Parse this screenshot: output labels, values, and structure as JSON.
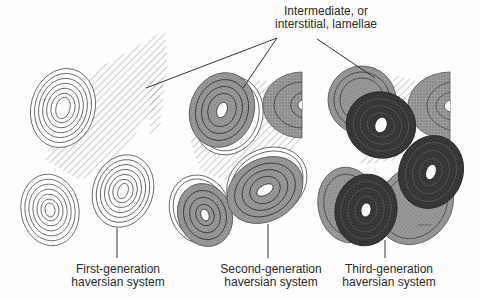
{
  "diagram": {
    "title_callout": {
      "line1": "Intermediate, or",
      "line2": "interstitial, lamellae"
    },
    "panels": [
      {
        "id": "first",
        "label_line1": "First-generation",
        "label_line2": "haversian system",
        "style": "outline-only"
      },
      {
        "id": "second",
        "label_line1": "Second-generation",
        "label_line2": "haversian system",
        "style": "gray-shaded"
      },
      {
        "id": "third",
        "label_line1": "Third-generation",
        "label_line2": "haversian system",
        "style": "dark-shaded"
      }
    ],
    "colors": {
      "line": "#555555",
      "first_gen_fill": "#ffffff",
      "second_gen_fill": "#8a8a8a",
      "third_gen_fill": "#2b2b2b",
      "hatch": "#9a9a9a",
      "background": "#fefefe"
    }
  }
}
